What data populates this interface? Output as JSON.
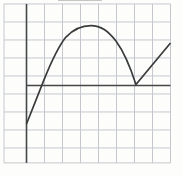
{
  "chart_data": {
    "type": "line",
    "title": "",
    "xlabel": "",
    "ylabel": "",
    "tick_labels": "none (unlabeled graph paper)",
    "xlim": [
      -1.25,
      8.0
    ],
    "ylim": [
      -4.3,
      4.53
    ],
    "grid": {
      "visible": true,
      "cell_units": 1,
      "x_lines": [
        -1.25,
        0,
        1,
        2,
        3,
        4,
        5,
        6,
        7,
        8
      ],
      "y_lines": [
        4.53,
        3.53,
        2.53,
        1.53,
        0.53,
        -0.47,
        -1.47,
        -2.47,
        -3.47,
        -4.3
      ]
    },
    "axes": {
      "x_axis": {
        "at_y": 0,
        "from_x": 0,
        "to_x": 8.0
      },
      "y_axis": {
        "at_x": 0,
        "from_y": -4.3,
        "to_y": 4.53
      }
    },
    "series": [
      {
        "name": "curve",
        "x": [
          0,
          0.5,
          1,
          1.5,
          2,
          2.5,
          3,
          3.5,
          4,
          4.5,
          5,
          5.5,
          6,
          6.08,
          6.5,
          7,
          7.5,
          8
        ],
        "y": [
          -2.14,
          -0.9,
          0.35,
          1.35,
          2.45,
          3.0,
          3.25,
          3.33,
          3.28,
          3.05,
          2.45,
          1.65,
          0.15,
          0.0,
          0.55,
          1.15,
          1.75,
          2.36
        ],
        "path_segments": [
          {
            "c": "M",
            "p": [
              0,
              -2.14
            ]
          },
          {
            "c": "L",
            "p": [
              0.97,
              0.31
            ]
          },
          {
            "c": "C",
            "p": [
              1.42,
              1.42,
              1.75,
              2.14,
              2.19,
              2.69
            ]
          },
          {
            "c": "C",
            "p": [
              2.64,
              3.17,
              3.08,
              3.33,
              3.58,
              3.33
            ]
          },
          {
            "c": "C",
            "p": [
              4.14,
              3.33,
              4.53,
              3.03,
              4.97,
              2.47
            ]
          },
          {
            "c": "C",
            "p": [
              5.36,
              1.94,
              5.75,
              1.08,
              6.08,
              0.06
            ]
          },
          {
            "c": "L",
            "p": [
              8.0,
              2.36
            ]
          }
        ]
      }
    ],
    "features": {
      "start_point": [
        0,
        -2.14
      ],
      "x_intercepts": [
        0.85,
        6.08
      ],
      "local_max": [
        3.58,
        3.33
      ],
      "corner_cusp": [
        6.08,
        0
      ],
      "end_point": [
        8.0,
        2.36
      ],
      "shape": "rising line, concave arch to maximum, descent to sharp corner on x-axis, rising line"
    },
    "scan_artifact_line": {
      "x_from": 1.75,
      "x_to": 4.19,
      "at_y": 4.72
    },
    "legend": "none"
  },
  "colors": {
    "background": "#fdfdfc",
    "gridline": "#c4c8ce",
    "axis": "#454648",
    "curve": "#3a3b3d",
    "artifact": "#8a8a8a"
  },
  "stroke_widths": {
    "gridline": 1,
    "axis": 1.6,
    "curve": 1.7,
    "artifact": 1
  }
}
